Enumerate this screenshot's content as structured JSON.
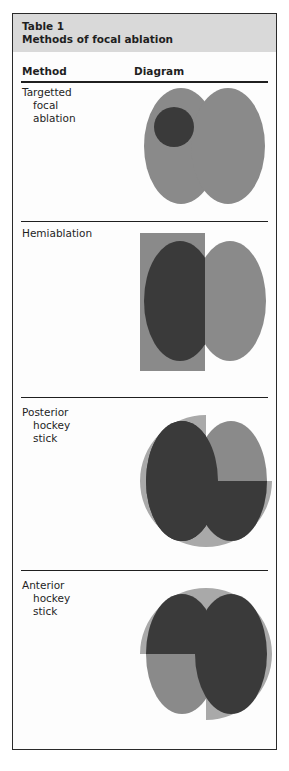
{
  "table": {
    "number": "Table 1",
    "title": "Methods of focal ablation",
    "columns": {
      "method": "Method",
      "diagram": "Diagram"
    },
    "rows": [
      {
        "label_lines": [
          "Targetted",
          "focal",
          "ablation"
        ],
        "diagram": "targetted-focal-ablation"
      },
      {
        "label_lines": [
          "Hemiablation"
        ],
        "diagram": "hemiablation"
      },
      {
        "label_lines": [
          "Posterior",
          "hockey",
          "stick"
        ],
        "diagram": "posterior-hockey-stick"
      },
      {
        "label_lines": [
          "Anterior",
          "hockey",
          "stick"
        ],
        "diagram": "anterior-hockey-stick"
      }
    ]
  },
  "colors": {
    "header_bg": "#d9d9d9",
    "prostate_gray": "#8a8a8a",
    "ablated_dark": "#3a3a3a",
    "margin_light": "#a9a9a9",
    "rule": "#1f1f1f"
  }
}
